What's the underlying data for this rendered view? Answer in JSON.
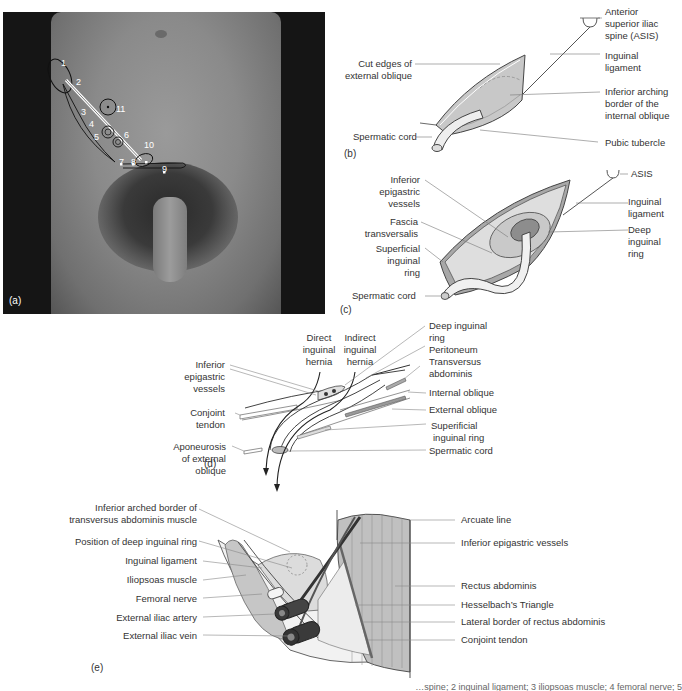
{
  "panel_a": {
    "letter": "(a)",
    "markers": [
      "1",
      "2",
      "3",
      "4",
      "5",
      "6",
      "7",
      "8",
      "9",
      "10",
      "11"
    ]
  },
  "panel_b": {
    "letter": "(b)",
    "labels": {
      "asis": "Anterior superior iliac spine (ASIS)",
      "asis_lines": [
        "Anterior",
        "superior iliac",
        "spine (ASIS)"
      ],
      "inguinal_ligament_lines": [
        "Inguinal",
        "ligament"
      ],
      "cut_edges_lines": [
        "Cut edges of",
        "external oblique"
      ],
      "inferior_arching_lines": [
        "Inferior arching",
        "border of the",
        "internal oblique"
      ],
      "spermatic_cord": "Spermatic cord",
      "pubic_tubercle": "Pubic tubercle"
    }
  },
  "panel_c": {
    "letter": "(c)",
    "labels": {
      "asis": "ASIS",
      "inferior_epigastric_lines": [
        "Inferior",
        "epigastric",
        "vessels"
      ],
      "fascia_lines": [
        "Fascia",
        "transversalis"
      ],
      "superficial_ring_lines": [
        "Superficial",
        "inguinal",
        "ring"
      ],
      "spermatic_cord": "Spermatic cord",
      "inguinal_ligament_lines": [
        "Inguinal",
        "ligament"
      ],
      "deep_ring_lines": [
        "Deep",
        "inguinal",
        "ring"
      ]
    }
  },
  "panel_d": {
    "letter": "(d)",
    "labels": {
      "direct_lines": [
        "Direct",
        "inguinal",
        "hernia"
      ],
      "indirect_lines": [
        "Indirect",
        "inguinal",
        "hernia"
      ],
      "inferior_epigastric_lines": [
        "Inferior",
        "epigastric",
        "vessels"
      ],
      "conjoint_lines": [
        "Conjoint",
        "tendon"
      ],
      "aponeurosis_lines": [
        "Aponeurosis",
        "of external",
        "oblique"
      ],
      "deep_ring_lines": [
        "Deep inguinal",
        "ring"
      ],
      "peritoneum": "Peritoneum",
      "transversus_lines": [
        "Transversus",
        "abdominis"
      ],
      "internal_oblique": "Internal oblique",
      "external_oblique": "External oblique",
      "superficial_ring_lines": [
        "Superificial",
        "inguinal ring"
      ],
      "spermatic_cord": "Spermatic cord"
    }
  },
  "panel_e": {
    "letter": "(e)",
    "left_labels": [
      "Inferior arched border of",
      "transversus abdominis muscle",
      "Position of deep inguinal ring",
      "Inguinal ligament",
      "Iliopsoas muscle",
      "Femoral nerve",
      "External iliac artery",
      "External iliac vein"
    ],
    "right_labels": [
      "Arcuate line",
      "Inferior epigastric vessels",
      "Rectus abdominis",
      "Hesselbach’s Triangle",
      "Lateral border of rectus abdominis",
      "Conjoint tendon"
    ]
  },
  "caption_partial": "…spine; 2 inguinal ligament; 3 iliopsoas muscle; 4 femoral nerve; 5",
  "colors": {
    "line": "#555555",
    "fill_light": "#e4e4e4",
    "fill_mid": "#bdbdbd",
    "fill_dark": "#8f8f8f",
    "vessel": "#3a3a3a"
  }
}
